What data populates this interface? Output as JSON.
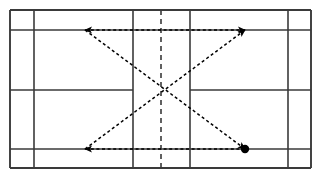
{
  "diagram": {
    "title": "Badminton court footwork movement pattern",
    "type": "court-diagram",
    "sport": "badminton",
    "description": "Badminton court viewed from above with dashed movement arrows forming an hourglass / bowtie pattern through the court centre, beginning at the filled dot at the rear right corner.",
    "canvas": {
      "width": 322,
      "height": 178,
      "background": "#ffffff"
    }
  },
  "style": {
    "court_line_color": "#3a3a3a",
    "court_line_width": 1.6,
    "outer_border_width": 1.9,
    "net_line_color": "#3a3a3a",
    "arrow_color": "#000000",
    "arrow_line_width": 1.5,
    "arrow_dash": "3,2.6",
    "net_dash": "5,4",
    "marker_fill": "#000000"
  },
  "court": {
    "outer_boundary": {
      "x1": 10,
      "y1": 10,
      "x2": 311,
      "y2": 168
    },
    "vertical_lines": [
      {
        "name": "left-outer-sideline",
        "x": 10,
        "y1": 10,
        "y2": 168,
        "style": "solid"
      },
      {
        "name": "left-singles-sideline",
        "x": 34,
        "y1": 10,
        "y2": 168,
        "style": "solid"
      },
      {
        "name": "left-short-service-line",
        "x": 133,
        "y1": 10,
        "y2": 168,
        "style": "solid"
      },
      {
        "name": "net-line",
        "x": 161,
        "y1": 10,
        "y2": 168,
        "style": "dashed"
      },
      {
        "name": "right-short-service-line",
        "x": 190,
        "y1": 10,
        "y2": 168,
        "style": "solid"
      },
      {
        "name": "right-singles-sideline",
        "x": 288,
        "y1": 10,
        "y2": 168,
        "style": "solid"
      },
      {
        "name": "right-outer-sideline",
        "x": 311,
        "y1": 10,
        "y2": 168,
        "style": "solid"
      }
    ],
    "horizontal_lines": [
      {
        "name": "top-doubles-long-service-line",
        "y": 10,
        "x1": 10,
        "x2": 311,
        "style": "solid"
      },
      {
        "name": "top-sideline",
        "y": 30,
        "x1": 10,
        "x2": 311,
        "style": "solid"
      },
      {
        "name": "bottom-sideline",
        "y": 149,
        "x1": 10,
        "x2": 311,
        "style": "solid"
      },
      {
        "name": "bottom-doubles-long-service-line",
        "y": 168,
        "x1": 10,
        "x2": 311,
        "style": "solid"
      }
    ],
    "centre_lines": [
      {
        "name": "left-centre-line",
        "y": 90,
        "x1": 10,
        "x2": 133,
        "style": "solid"
      },
      {
        "name": "right-centre-line",
        "y": 90,
        "x1": 190,
        "x2": 311,
        "style": "solid"
      }
    ]
  },
  "movement": {
    "centre_point": {
      "x": 161,
      "y": 90,
      "label": "court-centre"
    },
    "start_marker": {
      "x": 245,
      "y": 149,
      "radius": 4.2,
      "label": "starting-position"
    },
    "corners": {
      "front_left": {
        "x": 85,
        "y": 30
      },
      "front_right": {
        "x": 245,
        "y": 30
      },
      "rear_left": {
        "x": 85,
        "y": 149
      },
      "rear_right": {
        "x": 245,
        "y": 149
      }
    },
    "arrows": [
      {
        "name": "top-horizontal-arrow",
        "from": {
          "x": 245,
          "y": 30
        },
        "to": {
          "x": 85,
          "y": 30
        },
        "double_headed": true,
        "style": "dashed"
      },
      {
        "name": "diagonal-front-left-to-rear-right",
        "from": {
          "x": 85,
          "y": 30
        },
        "to": {
          "x": 245,
          "y": 149
        },
        "double_headed": false,
        "style": "dashed"
      },
      {
        "name": "bottom-horizontal-arrow",
        "from": {
          "x": 245,
          "y": 149
        },
        "to": {
          "x": 85,
          "y": 149
        },
        "double_headed": false,
        "style": "dashed"
      },
      {
        "name": "diagonal-rear-left-to-front-right",
        "from": {
          "x": 85,
          "y": 149
        },
        "to": {
          "x": 245,
          "y": 30
        },
        "double_headed": false,
        "style": "dashed"
      }
    ]
  }
}
